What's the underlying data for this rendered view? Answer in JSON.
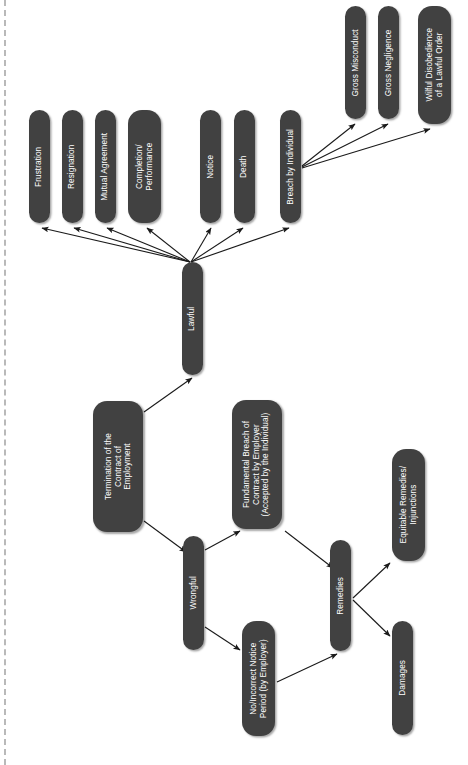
{
  "diagram": {
    "title": "Termination of the Contract of Employment",
    "orientation": "rotated-90",
    "node_fill": "#414141",
    "node_text_color": "#ffffff",
    "edge_color": "#1a1a1a",
    "background": "#ffffff",
    "nodes": [
      {
        "id": "frustration",
        "label": "Frustration",
        "x": 29,
        "y": 110,
        "w": 21,
        "h": 113,
        "r": 10.5,
        "fs": 8.2
      },
      {
        "id": "resignation",
        "label": "Resignation",
        "x": 62,
        "y": 110,
        "w": 21,
        "h": 113,
        "r": 10.5,
        "fs": 8.2
      },
      {
        "id": "mutual",
        "label": "Mutual Agreement",
        "x": 95,
        "y": 110,
        "w": 21,
        "h": 113,
        "r": 10.5,
        "fs": 8.2
      },
      {
        "id": "completion",
        "label": "Completion/\nPerformance",
        "x": 128,
        "y": 110,
        "w": 33,
        "h": 113,
        "r": 14,
        "fs": 8.2
      },
      {
        "id": "notice",
        "label": "Notice",
        "x": 200,
        "y": 110,
        "w": 21,
        "h": 113,
        "r": 10.5,
        "fs": 8.2
      },
      {
        "id": "death",
        "label": "Death",
        "x": 234,
        "y": 110,
        "w": 21,
        "h": 113,
        "r": 10.5,
        "fs": 8.2
      },
      {
        "id": "breach",
        "label": "Breach by Individual",
        "x": 280,
        "y": 110,
        "w": 21,
        "h": 113,
        "r": 10.5,
        "fs": 8.2
      },
      {
        "id": "gross-misconduct",
        "label": "Gross Misconduct",
        "x": 345,
        "y": 6,
        "w": 21,
        "h": 113,
        "r": 10.5,
        "fs": 8.2
      },
      {
        "id": "gross-negligence",
        "label": "Gross Negligence",
        "x": 378,
        "y": 6,
        "w": 21,
        "h": 113,
        "r": 10.5,
        "fs": 8.2
      },
      {
        "id": "wilful-disobedience",
        "label": "Wilful Disobedience\nof a Lawful Order",
        "x": 418,
        "y": 6,
        "w": 33,
        "h": 118,
        "r": 14,
        "fs": 8.2
      },
      {
        "id": "lawful",
        "label": "Lawful",
        "x": 182,
        "y": 262,
        "w": 21,
        "h": 113,
        "r": 10.5,
        "fs": 8.2
      },
      {
        "id": "termination",
        "label": "Termination of the\nContract of\nEmployment",
        "x": 93,
        "y": 401,
        "w": 50,
        "h": 131,
        "r": 14,
        "fs": 8.2
      },
      {
        "id": "wrongful",
        "label": "Wrongful",
        "x": 183,
        "y": 536,
        "w": 21,
        "h": 114,
        "r": 10.5,
        "fs": 8.2
      },
      {
        "id": "fundamental-breach",
        "label": "Fundamental Breach of\nContract by Employer\n(Accepted by the Individual)",
        "x": 232,
        "y": 400,
        "w": 50,
        "h": 129,
        "r": 14,
        "fs": 8.2
      },
      {
        "id": "no-notice",
        "label": "No/Incorrect Notice\nPeriod (by Employer)",
        "x": 242,
        "y": 621,
        "w": 33,
        "h": 115,
        "r": 14,
        "fs": 8.2
      },
      {
        "id": "remedies",
        "label": "Remedies",
        "x": 330,
        "y": 540,
        "w": 21,
        "h": 111,
        "r": 10.5,
        "fs": 8.2
      },
      {
        "id": "equitable",
        "label": "Equitable Remedies/\nInjunctions",
        "x": 392,
        "y": 449,
        "w": 33,
        "h": 112,
        "r": 14,
        "fs": 8.2
      },
      {
        "id": "damages",
        "label": "Damages",
        "x": 392,
        "y": 621,
        "w": 21,
        "h": 114,
        "r": 10.5,
        "fs": 8.2
      }
    ],
    "edges": [
      {
        "id": "lawful-to-frustration",
        "from": "lawful",
        "to": "frustration",
        "x1": 190,
        "y1": 262,
        "x2": 42,
        "y2": 228
      },
      {
        "id": "lawful-to-resignation",
        "from": "lawful",
        "to": "resignation",
        "x1": 190,
        "y1": 262,
        "x2": 74,
        "y2": 228
      },
      {
        "id": "lawful-to-mutual",
        "from": "lawful",
        "to": "mutual-agreement",
        "x1": 190,
        "y1": 262,
        "x2": 107,
        "y2": 228
      },
      {
        "id": "lawful-to-completion",
        "from": "lawful",
        "to": "completion",
        "x1": 190,
        "y1": 262,
        "x2": 147,
        "y2": 228
      },
      {
        "id": "lawful-to-notice",
        "from": "lawful",
        "to": "notice",
        "x1": 191,
        "y1": 262,
        "x2": 211,
        "y2": 228
      },
      {
        "id": "lawful-to-death",
        "from": "lawful",
        "to": "death",
        "x1": 191,
        "y1": 262,
        "x2": 243,
        "y2": 228
      },
      {
        "id": "lawful-to-breach",
        "from": "lawful",
        "to": "breach",
        "x1": 191,
        "y1": 262,
        "x2": 289,
        "y2": 228
      },
      {
        "id": "breach-to-misconduct",
        "from": "breach",
        "to": "gross-misconduct",
        "x1": 302,
        "y1": 166,
        "x2": 355,
        "y2": 124
      },
      {
        "id": "breach-to-negligence",
        "from": "breach",
        "to": "gross-negligence",
        "x1": 302,
        "y1": 167,
        "x2": 388,
        "y2": 124
      },
      {
        "id": "breach-to-disobedience",
        "from": "breach",
        "to": "wilful-disobedience",
        "x1": 302,
        "y1": 168,
        "x2": 430,
        "y2": 129
      },
      {
        "id": "termination-to-lawful",
        "from": "termination",
        "to": "lawful",
        "x1": 144,
        "y1": 412,
        "x2": 192,
        "y2": 378
      },
      {
        "id": "termination-to-wrongful",
        "from": "termination",
        "to": "wrongful",
        "x1": 144,
        "y1": 521,
        "x2": 186,
        "y2": 552
      },
      {
        "id": "wrongful-to-fundamental",
        "from": "wrongful",
        "to": "fundamental-breach",
        "x1": 205,
        "y1": 550,
        "x2": 240,
        "y2": 531
      },
      {
        "id": "wrongful-to-no-notice",
        "from": "wrongful",
        "to": "no-notice",
        "x1": 205,
        "y1": 627,
        "x2": 240,
        "y2": 650
      },
      {
        "id": "fundamental-to-remedies",
        "from": "fundamental-breach",
        "to": "remedies",
        "x1": 285,
        "y1": 531,
        "x2": 333,
        "y2": 568
      },
      {
        "id": "no-notice-to-remedies",
        "from": "no-notice",
        "to": "remedies",
        "x1": 277,
        "y1": 682,
        "x2": 337,
        "y2": 654
      },
      {
        "id": "remedies-to-equitable",
        "from": "remedies",
        "to": "equitable",
        "x1": 353,
        "y1": 598,
        "x2": 390,
        "y2": 563
      },
      {
        "id": "remedies-to-damages",
        "from": "remedies",
        "to": "damages",
        "x1": 353,
        "y1": 600,
        "x2": 390,
        "y2": 636
      }
    ]
  }
}
